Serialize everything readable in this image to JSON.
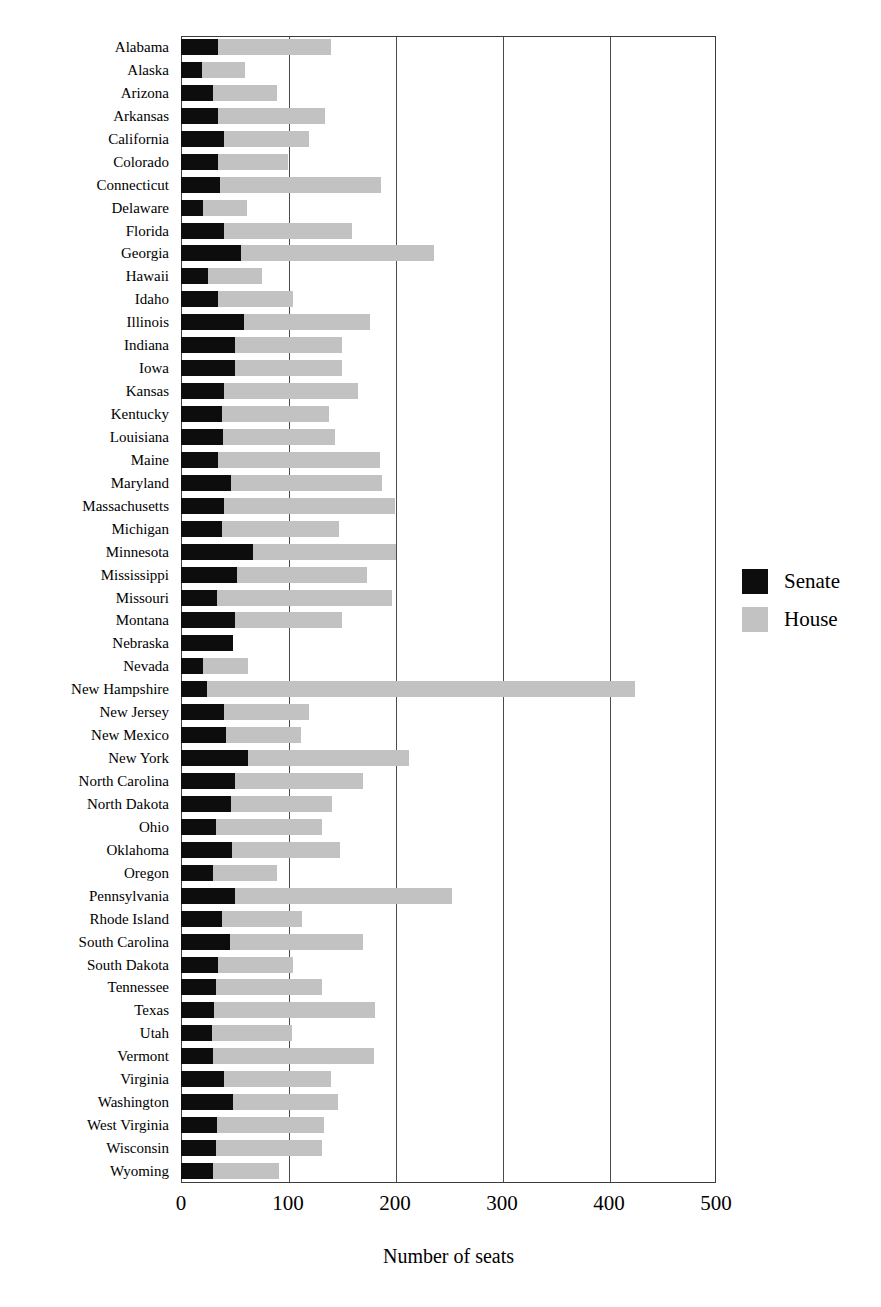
{
  "chart_data": {
    "type": "bar",
    "orientation": "horizontal",
    "stacked": true,
    "title": "",
    "xlabel": "Number of seats",
    "ylabel": "",
    "xlim": [
      0,
      500
    ],
    "xticks": [
      0,
      100,
      200,
      300,
      400,
      500
    ],
    "grid": "vertical",
    "legend_position": "right",
    "colors": {
      "senate": "#0d0d0d",
      "house": "#c2c2c2",
      "axis": "#3c3c3c",
      "background": "#ffffff"
    },
    "categories": [
      "Alabama",
      "Alaska",
      "Arizona",
      "Arkansas",
      "California",
      "Colorado",
      "Connecticut",
      "Delaware",
      "Florida",
      "Georgia",
      "Hawaii",
      "Idaho",
      "Illinois",
      "Indiana",
      "Iowa",
      "Kansas",
      "Kentucky",
      "Louisiana",
      "Maine",
      "Maryland",
      "Massachusetts",
      "Michigan",
      "Minnesota",
      "Mississippi",
      "Missouri",
      "Montana",
      "Nebraska",
      "Nevada",
      "New Hampshire",
      "New Jersey",
      "New Mexico",
      "New York",
      "North Carolina",
      "North Dakota",
      "Ohio",
      "Oklahoma",
      "Oregon",
      "Pennsylvania",
      "Rhode Island",
      "South Carolina",
      "South Dakota",
      "Tennessee",
      "Texas",
      "Utah",
      "Vermont",
      "Virginia",
      "Washington",
      "West Virginia",
      "Wisconsin",
      "Wyoming"
    ],
    "series": [
      {
        "name": "Senate",
        "color": "#0d0d0d",
        "values": [
          35,
          20,
          30,
          35,
          40,
          35,
          36,
          21,
          40,
          56,
          25,
          35,
          59,
          50,
          50,
          40,
          38,
          39,
          35,
          47,
          40,
          38,
          67,
          52,
          34,
          50,
          49,
          21,
          24,
          40,
          42,
          63,
          50,
          47,
          33,
          48,
          30,
          50,
          38,
          46,
          35,
          33,
          31,
          29,
          30,
          40,
          49,
          34,
          33,
          30
        ]
      },
      {
        "name": "House",
        "color": "#c2c2c2",
        "values": [
          105,
          40,
          60,
          100,
          80,
          65,
          151,
          41,
          120,
          180,
          51,
          70,
          118,
          100,
          100,
          125,
          100,
          105,
          151,
          141,
          160,
          110,
          134,
          122,
          163,
          100,
          0,
          42,
          400,
          80,
          70,
          150,
          120,
          94,
          99,
          101,
          60,
          203,
          75,
          124,
          70,
          99,
          150,
          75,
          150,
          100,
          98,
          100,
          99,
          62
        ]
      }
    ],
    "totals": [
      140,
      60,
      90,
      135,
      120,
      100,
      187,
      62,
      160,
      236,
      76,
      105,
      177,
      150,
      150,
      165,
      138,
      144,
      186,
      188,
      200,
      148,
      201,
      174,
      197,
      150,
      49,
      63,
      424,
      120,
      112,
      213,
      170,
      141,
      132,
      149,
      90,
      253,
      113,
      170,
      105,
      132,
      181,
      104,
      180,
      140,
      147,
      134,
      132,
      92
    ]
  },
  "axis": {
    "x_title": "Number of seats",
    "tick_labels": [
      "0",
      "100",
      "200",
      "300",
      "400",
      "500"
    ]
  },
  "legend": {
    "items": [
      {
        "label": "Senate",
        "swatch": "senate-swatch"
      },
      {
        "label": "House",
        "swatch": "house-swatch"
      }
    ]
  }
}
